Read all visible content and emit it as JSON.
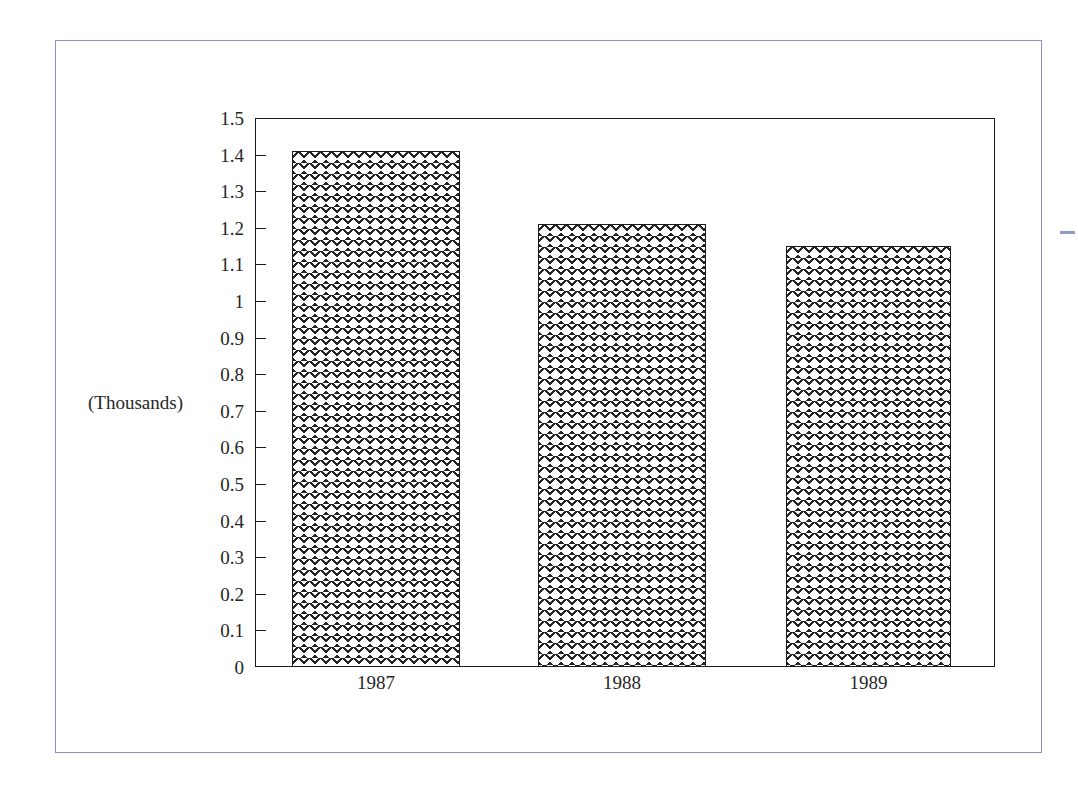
{
  "chart_data": {
    "type": "bar",
    "title": "",
    "subtitle": "",
    "xlabel": "",
    "ylabel": "(Thousands)",
    "categories": [
      "1987",
      "1988",
      "1989"
    ],
    "values": [
      1.41,
      1.21,
      1.15
    ],
    "series": [
      {
        "name": "",
        "values": [
          1.41,
          1.21,
          1.15
        ]
      }
    ],
    "ylim": [
      0,
      1.5
    ],
    "ytick_step": 0.1,
    "ytick_labels": [
      "1.5",
      "1.4",
      "1.3",
      "1.2",
      "1.1",
      "1",
      "0.9",
      "0.8",
      "0.7",
      "0.6",
      "0.5",
      "0.4",
      "0.3",
      "0.2",
      "0.1",
      "0"
    ],
    "ytick_values": [
      1.5,
      1.4,
      1.3,
      1.2,
      1.1,
      1.0,
      0.9,
      0.8,
      0.7,
      0.6,
      0.5,
      0.4,
      0.3,
      0.2,
      0.1,
      0
    ],
    "grid": false,
    "legend": "none",
    "bar_fill": "cross-hatch",
    "annotations": []
  },
  "style": {
    "frame_color": "#8892c8",
    "axis_color": "#1b1b1b",
    "text_color": "#262626",
    "bar_hatch_color": "#191919",
    "background": "#ffffff",
    "dash_mark_color": "#8f9ac9"
  }
}
